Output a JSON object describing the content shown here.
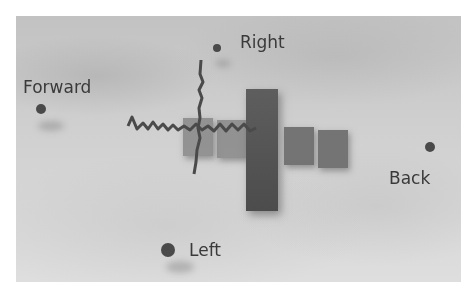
{
  "scene": {
    "description": "Grayscale photo of a simulated robot arm with block segments and wire-like trajectories on a textured floor, with direction labels",
    "labels": {
      "forward": "Forward",
      "right": "Right",
      "back": "Back",
      "left": "Left"
    },
    "colors": {
      "frame_background": "#ffffff",
      "label_text": "#3a3a3a",
      "marker_dot": "#4a4a4a",
      "block": "#6a6a6a"
    }
  }
}
